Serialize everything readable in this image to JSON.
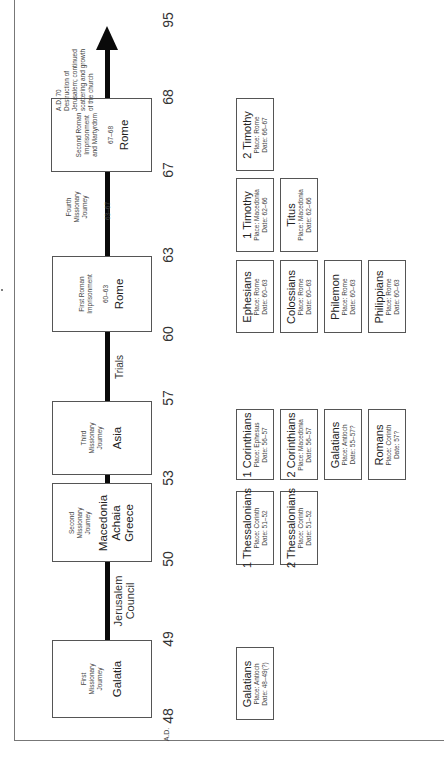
{
  "timeline": {
    "direction": "bottom-to-top (rotated -90°)",
    "years": [
      {
        "label": "95",
        "y": 20
      },
      {
        "label": "68",
        "y": 97
      },
      {
        "label": "67",
        "y": 170
      },
      {
        "label": "63",
        "y": 255
      },
      {
        "label": "60",
        "y": 334
      },
      {
        "label": "57",
        "y": 398
      },
      {
        "label": "53",
        "y": 478
      },
      {
        "label": "50",
        "y": 559
      },
      {
        "label": "49",
        "y": 639
      },
      {
        "label": "48",
        "y": 716
      }
    ],
    "ad_prefix": "A.D.",
    "events": [
      {
        "id": "first-journey",
        "lines": [
          "First",
          "Missionary",
          "Journey"
        ],
        "place": [
          "Galatia"
        ]
      },
      {
        "id": "second-journey",
        "lines": [
          "Second",
          "Missionary",
          "Journey"
        ],
        "place": [
          "Macedonia",
          "Achaia",
          "Greece"
        ]
      },
      {
        "id": "third-journey",
        "lines": [
          "Third",
          "Missionary",
          "Journey"
        ],
        "place": [
          "Asia"
        ]
      },
      {
        "id": "first-imprisonment",
        "lines": [
          "First Roman",
          "Imprisonment"
        ],
        "years": "60–63",
        "place": [
          "Rome"
        ]
      },
      {
        "id": "second-imprisonment",
        "lines": [
          "Second Roman",
          "Imprisonment",
          "and Martyrdom"
        ],
        "years": "67–68",
        "place": [
          "Rome"
        ]
      }
    ],
    "between": {
      "council": [
        "Jerusalem",
        "Council"
      ],
      "trials": "Trials",
      "fourth_journey": {
        "lines": [
          "Fourth",
          "Missionary",
          "Journey"
        ],
        "years": "63–67"
      },
      "ad70": [
        "A.D. 70",
        "Destruction of",
        "Jerusalem; continued",
        "scattering and growth",
        "of the church"
      ]
    }
  },
  "epistles": [
    {
      "title": "Galatians",
      "place": "Place: Antioch",
      "date": "Date: 48–49(?)"
    },
    {
      "title": "1 Thessalonians",
      "place": "Place: Corinth",
      "date": "Date: 51–52"
    },
    {
      "title": "2 Thessalonians",
      "place": "Place: Corinth",
      "date": "Date: 51–52"
    },
    {
      "title": "1 Corinthians",
      "place": "Place: Ephesus",
      "date": "Date: 56–57"
    },
    {
      "title": "2 Corinthians",
      "place": "Place: Macedonia",
      "date": "Date: 56–57"
    },
    {
      "title": "Galatians",
      "place": "Place: Antioch",
      "date": "Date: 55–57?"
    },
    {
      "title": "Romans",
      "place": "Place: Corinth",
      "date": "Date: 57?"
    },
    {
      "title": "Ephesians",
      "place": "Place: Rome",
      "date": "Date: 60–63"
    },
    {
      "title": "Colossians",
      "place": "Place: Rome",
      "date": "Date: 60–63"
    },
    {
      "title": "Philemon",
      "place": "Place: Rome",
      "date": "Date: 60–63"
    },
    {
      "title": "Philippians",
      "place": "Place: Rome",
      "date": "Date: 60–63"
    },
    {
      "title": "1 Timothy",
      "place": "Place: Macedonia",
      "date": "Date: 62–66"
    },
    {
      "title": "Titus",
      "place": "Place: Macedonia",
      "date": "Date: 62–66"
    },
    {
      "title": "2 Timothy",
      "place": "Place: Rome",
      "date": "Date: 66–67"
    }
  ]
}
